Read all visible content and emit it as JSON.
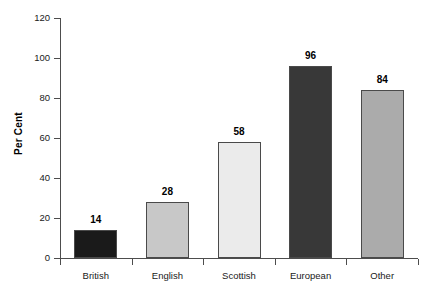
{
  "chart_data": {
    "type": "bar",
    "title": "",
    "xlabel": "",
    "ylabel": "Per Cent",
    "categories": [
      "British",
      "English",
      "Scottish",
      "European",
      "Other"
    ],
    "values": [
      14,
      28,
      58,
      96,
      84
    ],
    "value_labels": [
      "14",
      "28",
      "58",
      "96",
      "84"
    ],
    "bar_colors": [
      "#1a1a1a",
      "#c8c8c8",
      "#ebebeb",
      "#383838",
      "#ababab"
    ],
    "bar_border_color": "#4a4a4a",
    "ylim": [
      0,
      120
    ],
    "yticks": [
      0,
      20,
      40,
      60,
      80,
      100,
      120
    ],
    "ytick_labels": [
      "0",
      "20",
      "40",
      "60",
      "80",
      "100",
      "120"
    ],
    "grid": false,
    "legend": null,
    "axis_color": "#4d4d4d",
    "background": "#ffffff"
  }
}
